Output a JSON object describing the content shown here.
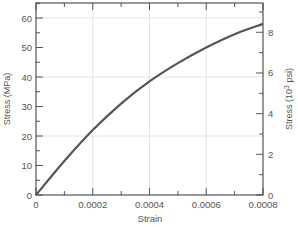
{
  "chart_data": {
    "type": "line",
    "title": "",
    "xlabel": "Strain",
    "ylabel": "Stress (MPa)",
    "ylabel_right": "Stress (10³ psi)",
    "xlim": [
      0,
      0.0008
    ],
    "ylim": [
      0,
      65
    ],
    "ylim_right": [
      0,
      9.43
    ],
    "grid": true,
    "x_ticks": [
      "0",
      "0.0002",
      "0.0004",
      "0.0006",
      "0.0008"
    ],
    "y_ticks": [
      "0",
      "10",
      "20",
      "30",
      "40",
      "50",
      "60"
    ],
    "y_ticks_right": [
      "0",
      "2",
      "4",
      "6",
      "8"
    ],
    "series": [
      {
        "name": "Stress-strain curve",
        "x": [
          0,
          0.0001,
          0.0002,
          0.0003,
          0.0004,
          0.0005,
          0.0006,
          0.0007,
          0.0008
        ],
        "y": [
          0,
          11.5,
          22,
          31,
          38.5,
          44.7,
          50,
          54.5,
          58
        ]
      }
    ],
    "colors": {
      "line": "#555555",
      "axis": "#444444",
      "grid": "#dddddd",
      "text": "#555555"
    }
  }
}
